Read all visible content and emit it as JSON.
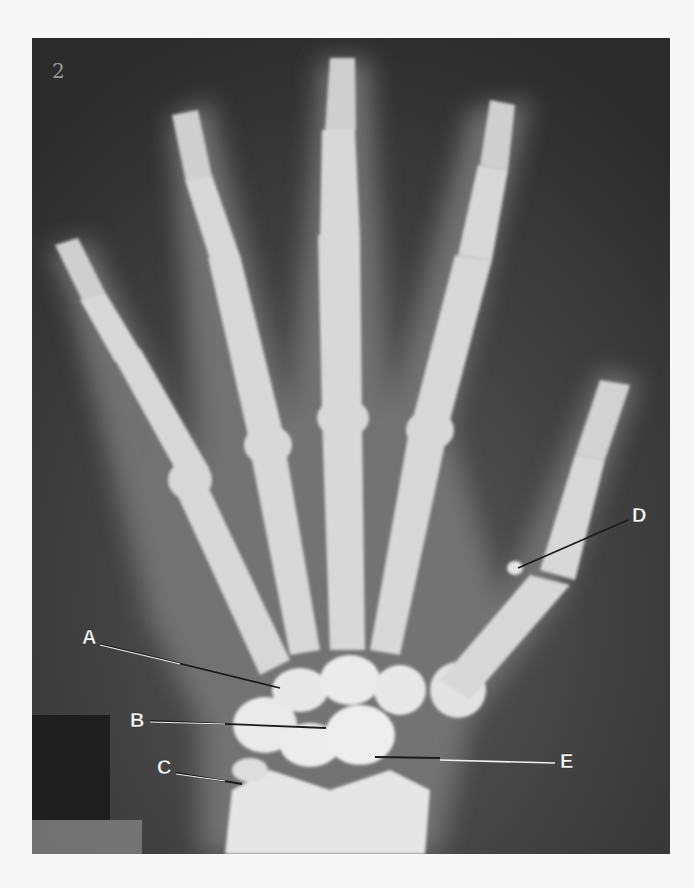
{
  "figure": {
    "type": "x-ray radiograph",
    "corner_mark": "2"
  },
  "labels": [
    {
      "id": "A",
      "text": "A"
    },
    {
      "id": "B",
      "text": "B"
    },
    {
      "id": "C",
      "text": "C"
    },
    {
      "id": "D",
      "text": "D"
    },
    {
      "id": "E",
      "text": "E"
    }
  ],
  "colors": {
    "background_dark": "#3a3a3a",
    "bone": "#e4e4e4",
    "label_text": "#ffffff",
    "page": "#f7f7f7"
  }
}
